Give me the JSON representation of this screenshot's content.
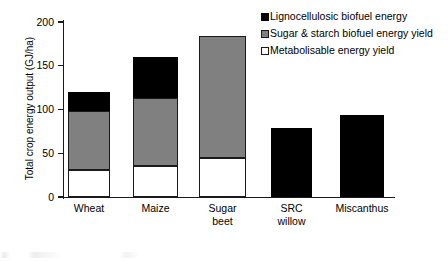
{
  "chart_data": {
    "type": "bar",
    "subtype": "stacked",
    "title": "",
    "xlabel": "",
    "ylabel": "Total crop energy output (GJ/ha)",
    "ylim": [
      0,
      200
    ],
    "yticks": [
      0,
      50,
      100,
      150,
      200
    ],
    "grid": false,
    "legend_position": "top-right",
    "categories": [
      "Wheat",
      "Maize",
      "Sugar beet",
      "SRC willow",
      "Miscanthus"
    ],
    "category_lines": [
      [
        "Wheat"
      ],
      [
        "Maize"
      ],
      [
        "Sugar",
        "beet"
      ],
      [
        "SRC",
        "willow"
      ],
      [
        "Miscanthus"
      ]
    ],
    "series": [
      {
        "name": "Metabolisable energy yield",
        "color": "#ffffff",
        "values": [
          31,
          36,
          45,
          0,
          0
        ]
      },
      {
        "name": "Sugar & starch biofuel energy yield",
        "color": "#808080",
        "values": [
          67,
          77,
          139,
          0,
          0
        ]
      },
      {
        "name": "Lignocellulosic biofuel energy",
        "color": "#000000",
        "values": [
          22,
          47,
          0,
          79,
          94
        ]
      }
    ],
    "totals": [
      120,
      160,
      184,
      79,
      94
    ],
    "stack_order_bottom_to_top": [
      "Metabolisable energy yield",
      "Sugar & starch biofuel energy yield",
      "Lignocellulosic biofuel energy"
    ]
  },
  "legend": {
    "items": [
      {
        "label": "Lignocellulosic biofuel energy",
        "swatch": "black"
      },
      {
        "label": "Sugar & starch biofuel energy yield",
        "swatch": "gray"
      },
      {
        "label": "Metabolisable energy yield",
        "swatch": "white"
      }
    ]
  },
  "axis": {
    "y_title": "Total crop energy output (GJ/ha)",
    "y_tick_labels": [
      "200",
      "150",
      "100",
      "50",
      "0"
    ]
  },
  "colors": {
    "lignocellulosic": "#000000",
    "sugar_starch": "#808080",
    "metabolisable": "#ffffff",
    "axis": "#1a1a1a"
  }
}
